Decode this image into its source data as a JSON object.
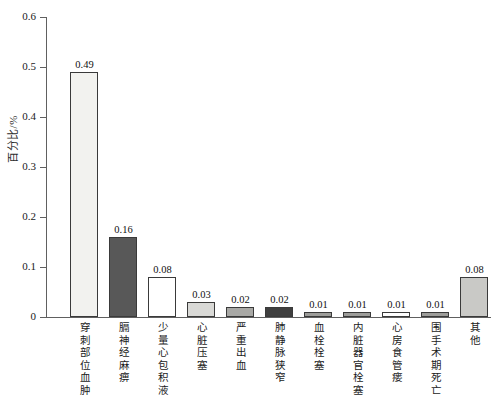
{
  "chart_data": {
    "type": "bar",
    "title": "",
    "subtitle": "",
    "xlabel": "",
    "ylabel": "百分比/%",
    "ylim": [
      0,
      0.6
    ],
    "yticks": [
      "0",
      "0.1",
      "0.2",
      "0.3",
      "0.4",
      "0.5",
      "0.6"
    ],
    "ytick_values": [
      0,
      0.1,
      0.2,
      0.3,
      0.4,
      0.5,
      0.6
    ],
    "grid": false,
    "legend": "none",
    "categories": [
      "穿刺部位血肿",
      "膈神经麻痹",
      "少量心包积液",
      "心脏压塞",
      "严重出血",
      "肺静脉狭窄",
      "血栓栓塞",
      "内脏器官栓塞",
      "心房食管瘘",
      "围手术期死亡",
      "其他"
    ],
    "values": [
      0.49,
      0.16,
      0.08,
      0.03,
      0.02,
      0.02,
      0.01,
      0.01,
      0.01,
      0.01,
      0.08
    ],
    "value_labels": [
      "0.49",
      "0.16",
      "0.08",
      "0.03",
      "0.02",
      "0.02",
      "0.01",
      "0.01",
      "0.01",
      "0.01",
      "0.08"
    ],
    "bar_colors": [
      "#f2f2ef",
      "#585858",
      "#ffffff",
      "#d9d9d6",
      "#a8a8a5",
      "#3f3f3f",
      "#9d9d9a",
      "#9d9d9a",
      "#ffffff",
      "#9d9d9a",
      "#c9c9c6"
    ],
    "bar_edge_color": "#3a3a3a",
    "axis_color": "#606060"
  }
}
